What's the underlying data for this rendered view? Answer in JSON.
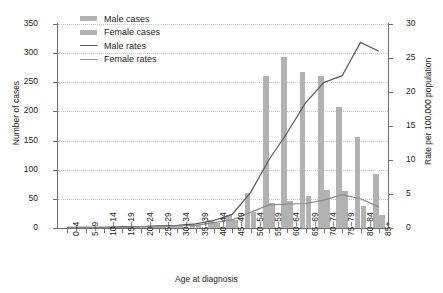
{
  "chart_data": {
    "type": "bar",
    "title": "",
    "xlabel": "Age at diagnosis",
    "ylabel": "Number of cases",
    "ylabel_right": "Rate per 100,000 population",
    "ylim": [
      0,
      350
    ],
    "ylim_right": [
      0,
      30
    ],
    "yticks": [
      0,
      50,
      100,
      150,
      200,
      250,
      300,
      350
    ],
    "yticks_right": [
      0,
      5,
      10,
      15,
      20,
      25,
      30
    ],
    "grid": true,
    "legend_position": "top-left",
    "categories": [
      "0–4",
      "5–9",
      "10–14",
      "15–19",
      "20–24",
      "25–29",
      "30–34",
      "35–39",
      "40–44",
      "45–49",
      "50–54",
      "55–59",
      "60–64",
      "65–69",
      "70–74",
      "75–79",
      "80–84",
      "85+"
    ],
    "series": [
      {
        "name": "Male cases",
        "kind": "bar",
        "axis": "left",
        "color": "#b2b2b2",
        "values": [
          0,
          1,
          1,
          2,
          2,
          3,
          4,
          7,
          13,
          23,
          60,
          260,
          293,
          268,
          261,
          207,
          156,
          92
        ]
      },
      {
        "name": "Female cases",
        "kind": "bar",
        "axis": "left",
        "color": "#b2b2b2",
        "values": [
          0,
          1,
          1,
          1,
          2,
          2,
          3,
          5,
          9,
          14,
          27,
          43,
          46,
          55,
          65,
          63,
          37,
          22
        ]
      },
      {
        "name": "Male rates",
        "kind": "line",
        "axis": "right",
        "color": "#58595b",
        "values": [
          0.1,
          0.1,
          0.1,
          0.2,
          0.2,
          0.3,
          0.4,
          0.6,
          1.1,
          2.0,
          5.2,
          10.0,
          14.0,
          18.4,
          21.4,
          22.4,
          27.3,
          26.0
        ]
      },
      {
        "name": "Female rates",
        "kind": "line",
        "axis": "right",
        "color": "#8a8c8e",
        "values": [
          0.1,
          0.1,
          0.1,
          0.1,
          0.2,
          0.2,
          0.3,
          0.4,
          0.8,
          1.2,
          2.3,
          3.4,
          3.5,
          3.6,
          4.1,
          4.9,
          4.3,
          3.1
        ]
      }
    ]
  },
  "legend": {
    "items": [
      {
        "label": "Male cases",
        "type": "bar",
        "color": "#b2b2b2"
      },
      {
        "label": "Female cases",
        "type": "bar",
        "color": "#b2b2b2"
      },
      {
        "label": "Male rates",
        "type": "line",
        "color": "#58595b"
      },
      {
        "label": "Female rates",
        "type": "line",
        "color": "#8a8c8e"
      }
    ]
  }
}
